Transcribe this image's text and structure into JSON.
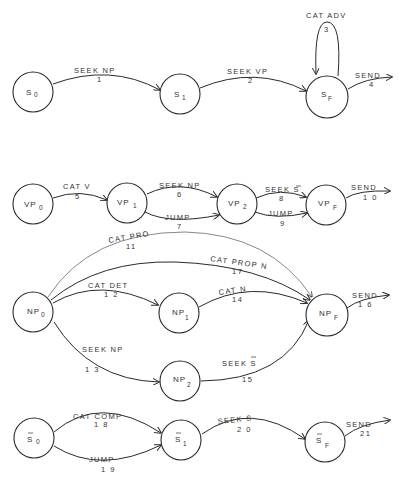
{
  "networks": [
    {
      "id": "S",
      "nodes": [
        {
          "id": "S0",
          "base": "S",
          "sub": "0",
          "bar": false
        },
        {
          "id": "S1",
          "base": "S",
          "sub": "1",
          "bar": false
        },
        {
          "id": "SF",
          "base": "S",
          "sub": "F",
          "bar": false
        }
      ],
      "arcs": [
        {
          "from": "S0",
          "to": "S1",
          "label": "SEEK NP",
          "num": "1"
        },
        {
          "from": "S1",
          "to": "SF",
          "label": "SEEK VP",
          "num": "2"
        },
        {
          "from": "SF",
          "to": "SF",
          "label": "CAT ADV",
          "num": "3"
        },
        {
          "from": "SF",
          "to": null,
          "label": "SEND",
          "num": "4"
        }
      ]
    },
    {
      "id": "VP",
      "nodes": [
        {
          "id": "VP0",
          "base": "VP",
          "sub": "0",
          "bar": false
        },
        {
          "id": "VP1",
          "base": "VP",
          "sub": "1",
          "bar": false
        },
        {
          "id": "VP2",
          "base": "VP",
          "sub": "2",
          "bar": false
        },
        {
          "id": "VPF",
          "base": "VP",
          "sub": "F",
          "bar": false
        }
      ],
      "arcs": [
        {
          "from": "VP0",
          "to": "VP1",
          "label": "CAT V",
          "num": "5"
        },
        {
          "from": "VP1",
          "to": "VP2",
          "label": "SEEK NP",
          "num": "6"
        },
        {
          "from": "VP1",
          "to": "VP2",
          "label": "JUMP",
          "num": "7"
        },
        {
          "from": "VP2",
          "to": "VPF",
          "label": "SEEK S̄",
          "num": "8"
        },
        {
          "from": "VP2",
          "to": "VPF",
          "label": "JUMP",
          "num": "9"
        },
        {
          "from": "VPF",
          "to": null,
          "label": "SEND",
          "num": "10"
        }
      ]
    },
    {
      "id": "NP",
      "nodes": [
        {
          "id": "NP0",
          "base": "NP",
          "sub": "0",
          "bar": false
        },
        {
          "id": "NP1",
          "base": "NP",
          "sub": "1",
          "bar": false
        },
        {
          "id": "NP2",
          "base": "NP",
          "sub": "2",
          "bar": false
        },
        {
          "id": "NPF",
          "base": "NP",
          "sub": "F",
          "bar": false
        }
      ],
      "arcs": [
        {
          "from": "NP0",
          "to": "NPF",
          "label": "CAT PRO",
          "num": "11"
        },
        {
          "from": "NP0",
          "to": "NP1",
          "label": "CAT DET",
          "num": "12"
        },
        {
          "from": "NP0",
          "to": "NP2",
          "label": "SEEK NP",
          "num": "13"
        },
        {
          "from": "NP1",
          "to": "NPF",
          "label": "CAT N",
          "num": "14"
        },
        {
          "from": "NP2",
          "to": "NPF",
          "label": "SEEK S̄",
          "num": "15"
        },
        {
          "from": "NPF",
          "to": null,
          "label": "SEND",
          "num": "16"
        },
        {
          "from": "NP0",
          "to": "NPF",
          "label": "CAT PROP N",
          "num": "17"
        }
      ]
    },
    {
      "id": "S-bar",
      "nodes": [
        {
          "id": "SB0",
          "base": "S",
          "sub": "0",
          "bar": true
        },
        {
          "id": "SB1",
          "base": "S",
          "sub": "1",
          "bar": true
        },
        {
          "id": "SBF",
          "base": "S",
          "sub": "F",
          "bar": true
        }
      ],
      "arcs": [
        {
          "from": "SB0",
          "to": "SB1",
          "label": "CAT COMP",
          "num": "18"
        },
        {
          "from": "SB0",
          "to": "SB1",
          "label": "JUMP",
          "num": "19"
        },
        {
          "from": "SB1",
          "to": "SBF",
          "label": "SEEK S",
          "num": "20"
        },
        {
          "from": "SBF",
          "to": null,
          "label": "SEND",
          "num": "21"
        }
      ]
    }
  ],
  "labels": {
    "s": {
      "n0": "S",
      "n0sub": "0",
      "n1": "S",
      "n1sub": "1",
      "nf": "S",
      "nfsub": "F",
      "a1": "SEEK NP",
      "a1n": "1",
      "a2": "SEEK VP",
      "a2n": "2",
      "a3": "CAT ADV",
      "a3n": "3",
      "a4": "SEND",
      "a4n": "4"
    },
    "vp": {
      "n0": "VP",
      "n0sub": "0",
      "n1": "VP",
      "n1sub": "1",
      "n2": "VP",
      "n2sub": "2",
      "nf": "VP",
      "nfsub": "F",
      "a5": "CAT V",
      "a5n": "5",
      "a6": "SEEK NP",
      "a6n": "6",
      "a7": "JUMP",
      "a7n": "7",
      "a8": "SEEK S",
      "a8n": "8",
      "a9": "JUMP",
      "a9n": "9",
      "a10": "SEND",
      "a10n": "1 0"
    },
    "np": {
      "n0": "NP",
      "n0sub": "0",
      "n1": "NP",
      "n1sub": "1",
      "n2": "NP",
      "n2sub": "2",
      "nf": "NP",
      "nfsub": "F",
      "a11": "CAT PRO",
      "a11n": "11",
      "a12": "CAT DET",
      "a12n": "1 2",
      "a13": "SEEK NP",
      "a13n": "1 3",
      "a14": "CAT N",
      "a14n": "14",
      "a15": "SEEK S",
      "a15n": "15",
      "a16": "SEND",
      "a16n": "1 6",
      "a17": "CAT PROP N",
      "a17n": "17"
    },
    "sb": {
      "n0": "S",
      "n0sub": "0",
      "n1": "S",
      "n1sub": "1",
      "nf": "S",
      "nfsub": "F",
      "a18": "CAT COMP",
      "a18n": "1 8",
      "a19": "JUMP",
      "a19n": "1 9",
      "a20": "SEEK S",
      "a20n": "2 0",
      "a21": "SEND",
      "a21n": "21"
    }
  }
}
